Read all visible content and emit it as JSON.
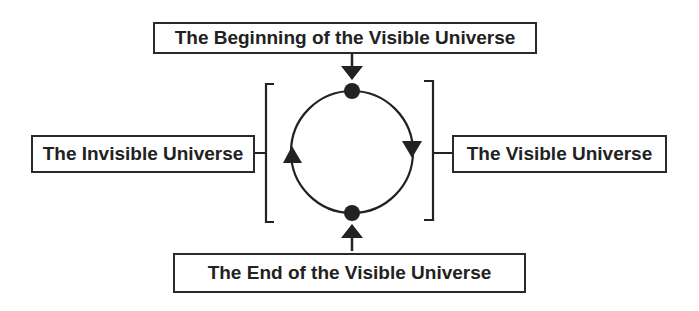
{
  "diagram": {
    "type": "cycle",
    "nodes": {
      "top": {
        "label": "The Beginning of the Visible Universe"
      },
      "left": {
        "label": "The Invisible Universe"
      },
      "right": {
        "label": "The Visible Universe"
      },
      "bottom": {
        "label": "The End of the Visible Universe"
      }
    },
    "cycle": {
      "direction": "clockwise",
      "points": [
        "top-dot",
        "bottom-dot"
      ],
      "arrows": [
        "right-side-down",
        "left-side-up"
      ]
    },
    "connections": [
      {
        "from": "top",
        "to": "top-dot",
        "style": "arrow-down"
      },
      {
        "from": "bottom",
        "to": "bottom-dot",
        "style": "arrow-up"
      },
      {
        "from": "left",
        "to": "left-bracket",
        "style": "line"
      },
      {
        "from": "right",
        "to": "right-bracket",
        "style": "line"
      }
    ],
    "colors": {
      "stroke": "#222222",
      "background": "#ffffff"
    }
  }
}
